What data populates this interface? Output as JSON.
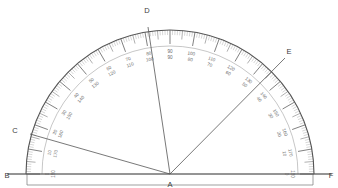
{
  "figure": {
    "type": "protractor-diagram",
    "background_color": "#ffffff",
    "line_color": "#555555",
    "tick_color": "#6e6e6e",
    "label_color": "#6a6a6a",
    "point_label_color": "#3b3b3b"
  },
  "geometry": {
    "center": {
      "x": 170,
      "y": 174,
      "label": "A"
    },
    "radius_outer": 144,
    "radius_inner": 128,
    "baseline": {
      "x1": 8,
      "y1": 174,
      "x2": 332,
      "y2": 174
    },
    "base_bar": {
      "left": 27,
      "right": 313,
      "top": 174,
      "bottom": 185
    }
  },
  "points": [
    {
      "name": "B",
      "label": "B",
      "x": 7,
      "y": 174,
      "label_x": 7,
      "label_y": 176
    },
    {
      "name": "A",
      "label": "A",
      "x": 170,
      "y": 174,
      "label_x": 170,
      "label_y": 185
    },
    {
      "name": "F",
      "label": "F",
      "x": 331,
      "y": 174,
      "label_x": 331,
      "label_y": 176
    },
    {
      "name": "C",
      "label": "C",
      "x": 30,
      "y": 134,
      "label_x": 15,
      "label_y": 131
    },
    {
      "name": "D",
      "label": "D",
      "x": 148,
      "y": 27,
      "label_x": 147,
      "label_y": 11
    },
    {
      "name": "E",
      "label": "E",
      "x": 285,
      "y": 58,
      "label_x": 289,
      "label_y": 52
    }
  ],
  "rays": [
    {
      "name": "ray-AB",
      "from": "A",
      "to": "B",
      "angle_deg": 180
    },
    {
      "name": "ray-AC",
      "from": "A",
      "to": "C",
      "angle_deg": 164
    },
    {
      "name": "ray-AD",
      "from": "A",
      "to": "D",
      "angle_deg": 98
    },
    {
      "name": "ray-AE",
      "from": "A",
      "to": "E",
      "angle_deg": 45
    },
    {
      "name": "ray-AF",
      "from": "A",
      "to": "F",
      "angle_deg": 0
    }
  ],
  "scale": {
    "step_deg": 10,
    "minor_step_deg": 1,
    "mid_step_deg": 5,
    "outer_values": [
      0,
      10,
      20,
      30,
      40,
      50,
      60,
      70,
      80,
      90,
      100,
      110,
      120,
      130,
      140,
      150,
      160,
      170,
      180
    ],
    "inner_values": [
      180,
      170,
      160,
      150,
      140,
      130,
      120,
      110,
      100,
      90,
      80,
      70,
      60,
      50,
      40,
      30,
      20,
      10,
      0
    ],
    "labels": [
      {
        "deg_from_right": 0,
        "outer": "0",
        "inner": "180"
      },
      {
        "deg_from_right": 10,
        "outer": "10",
        "inner": "170"
      },
      {
        "deg_from_right": 20,
        "outer": "20",
        "inner": "160"
      },
      {
        "deg_from_right": 30,
        "outer": "30",
        "inner": "150"
      },
      {
        "deg_from_right": 40,
        "outer": "40",
        "inner": "140"
      },
      {
        "deg_from_right": 50,
        "outer": "50",
        "inner": "130"
      },
      {
        "deg_from_right": 60,
        "outer": "60",
        "inner": "120"
      },
      {
        "deg_from_right": 70,
        "outer": "70",
        "inner": "110"
      },
      {
        "deg_from_right": 80,
        "outer": "80",
        "inner": "100"
      },
      {
        "deg_from_right": 90,
        "outer": "90",
        "inner": "90"
      },
      {
        "deg_from_right": 100,
        "outer": "100",
        "inner": "80"
      },
      {
        "deg_from_right": 110,
        "outer": "110",
        "inner": "70"
      },
      {
        "deg_from_right": 120,
        "outer": "120",
        "inner": "60"
      },
      {
        "deg_from_right": 130,
        "outer": "130",
        "inner": "50"
      },
      {
        "deg_from_right": 140,
        "outer": "140",
        "inner": "40"
      },
      {
        "deg_from_right": 150,
        "outer": "150",
        "inner": "30"
      },
      {
        "deg_from_right": 160,
        "outer": "160",
        "inner": "20"
      },
      {
        "deg_from_right": 170,
        "outer": "170",
        "inner": "10"
      },
      {
        "deg_from_right": 180,
        "outer": "180",
        "inner": "0"
      }
    ]
  }
}
